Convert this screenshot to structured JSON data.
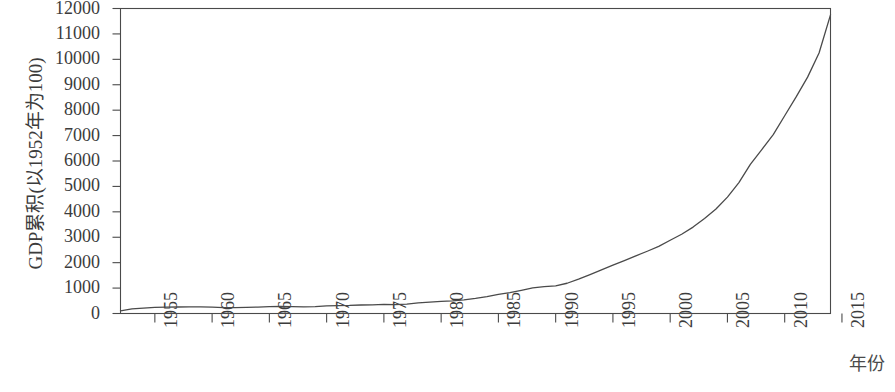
{
  "chart_data": {
    "type": "line",
    "title": "",
    "subtitle": "",
    "xlabel": "年份",
    "ylabel": "GDP累积(以1952年为100)",
    "xlim": [
      1952,
      2014
    ],
    "ylim": [
      0,
      12000
    ],
    "grid": false,
    "legend": null,
    "legend_position": "none",
    "y_ticks": [
      12000,
      11000,
      10000,
      9000,
      8000,
      7000,
      6000,
      5000,
      4000,
      3000,
      2000,
      1000,
      0
    ],
    "x_ticks": [
      1955,
      1960,
      1965,
      1970,
      1975,
      1980,
      1985,
      1990,
      1995,
      2000,
      2005,
      2010,
      2015
    ],
    "x_tick_labels": [
      "1955",
      "1960",
      "1965",
      "1970",
      "1975",
      "1980",
      "1985",
      "1990",
      "1995",
      "2000",
      "2005",
      "2010",
      "2015"
    ],
    "line_color": "#4a4a4a",
    "line_width": 1.3,
    "series": [
      {
        "name": "GDP累积指数",
        "x": [
          1952,
          1953,
          1954,
          1955,
          1956,
          1957,
          1958,
          1959,
          1960,
          1961,
          1962,
          1963,
          1964,
          1965,
          1966,
          1967,
          1968,
          1969,
          1970,
          1971,
          1972,
          1973,
          1974,
          1975,
          1976,
          1977,
          1978,
          1979,
          1980,
          1981,
          1982,
          1983,
          1984,
          1985,
          1986,
          1987,
          1988,
          1989,
          1990,
          1991,
          1992,
          1993,
          1994,
          1995,
          1996,
          1997,
          1998,
          1999,
          2000,
          2001,
          2002,
          2003,
          2004,
          2005,
          2006,
          2007,
          2008,
          2009,
          2010,
          2011,
          2012,
          2013,
          2014
        ],
        "y": [
          100,
          180,
          210,
          240,
          250,
          255,
          262,
          258,
          248,
          232,
          228,
          238,
          252,
          268,
          275,
          268,
          262,
          272,
          300,
          312,
          318,
          335,
          340,
          362,
          352,
          372,
          415,
          445,
          478,
          500,
          535,
          592,
          660,
          752,
          818,
          912,
          1010,
          1055,
          1090,
          1190,
          1350,
          1530,
          1720,
          1900,
          2080,
          2270,
          2450,
          2640,
          2880,
          3120,
          3400,
          3740,
          4110,
          4580,
          5150,
          5870,
          6450,
          7040,
          7780,
          8520,
          9300,
          10250,
          11750
        ]
      }
    ]
  },
  "axes": {
    "y_title": "GDP累积(以1952年为100)",
    "x_title": "年份"
  }
}
